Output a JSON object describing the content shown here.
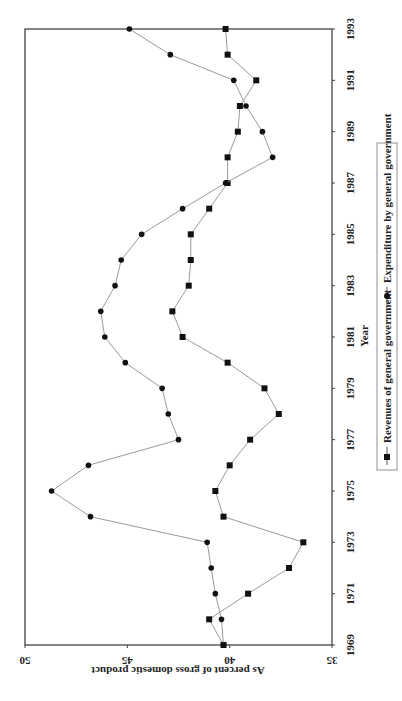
{
  "chart_data": {
    "type": "line",
    "title": "",
    "xlabel": "Year",
    "ylabel": "As percent of gross domestic product",
    "ylim": [
      35,
      50
    ],
    "yticks": [
      35,
      40,
      45,
      50
    ],
    "xticks": [
      1969,
      1971,
      1973,
      1975,
      1977,
      1979,
      1981,
      1983,
      1985,
      1987,
      1989,
      1991,
      1993
    ],
    "grid": false,
    "legend_position": "bottom",
    "orientation_note": "figure rotated 90 degrees counter-clockwise on page",
    "x": [
      1969,
      1970,
      1971,
      1972,
      1973,
      1974,
      1975,
      1976,
      1977,
      1978,
      1979,
      1980,
      1981,
      1982,
      1983,
      1984,
      1985,
      1986,
      1987,
      1988,
      1989,
      1990,
      1991,
      1992,
      1993
    ],
    "series": [
      {
        "name": "Revenues of general government",
        "marker": "square",
        "values": [
          40.3,
          41.0,
          39.1,
          37.1,
          36.4,
          40.3,
          40.7,
          40.0,
          39.0,
          37.6,
          38.3,
          40.1,
          42.3,
          42.8,
          42.0,
          41.9,
          41.9,
          41.0,
          40.1,
          40.1,
          39.6,
          39.5,
          38.7,
          40.1,
          40.2
        ]
      },
      {
        "name": "Expenditure by general government",
        "marker": "circle",
        "values": [
          40.3,
          40.4,
          40.7,
          40.9,
          41.1,
          46.8,
          48.7,
          46.9,
          42.5,
          43.0,
          43.3,
          45.1,
          46.1,
          46.3,
          45.6,
          45.3,
          44.3,
          42.3,
          40.2,
          37.9,
          38.4,
          39.2,
          39.8,
          42.9,
          44.9
        ]
      }
    ]
  },
  "colors": {
    "line": "#9a9a9a",
    "marker": "#111111",
    "frame": "#444444"
  }
}
